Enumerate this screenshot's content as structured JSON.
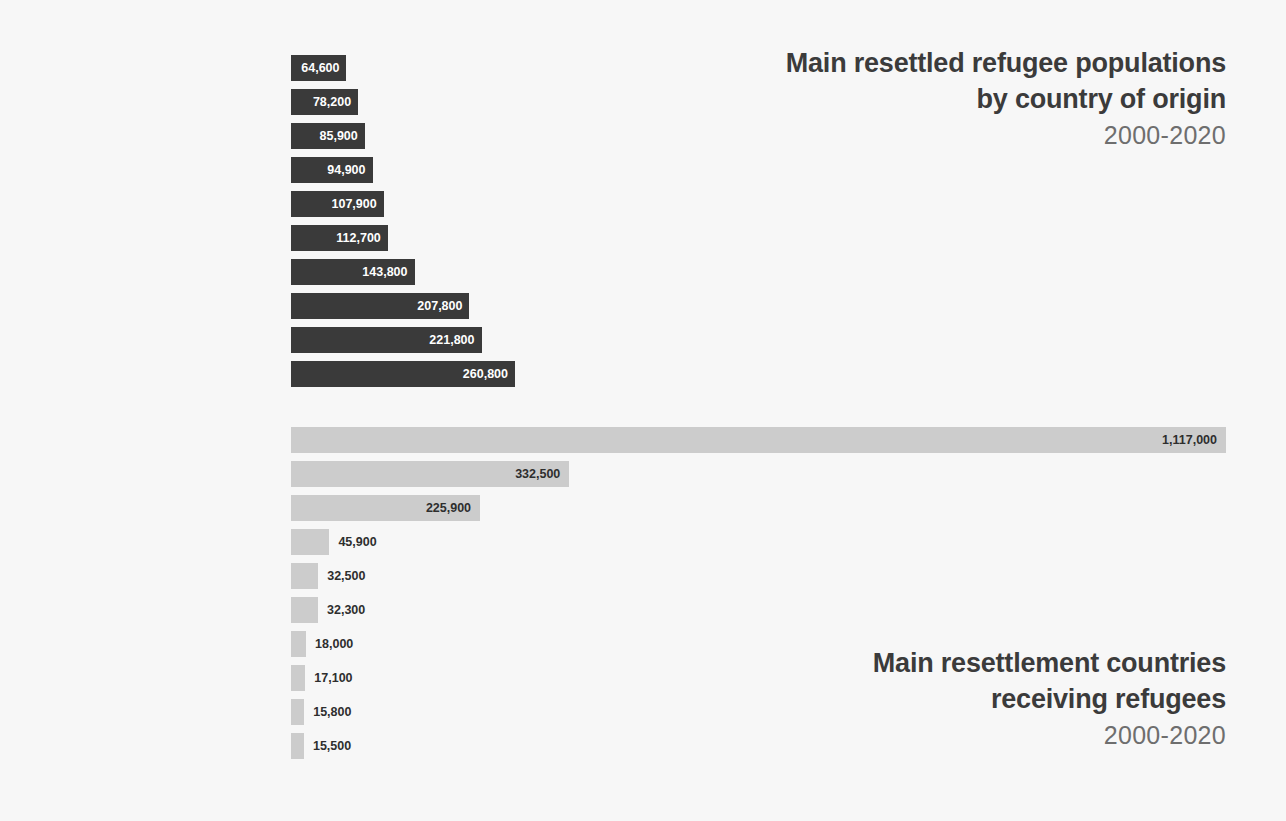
{
  "chart_data": [
    {
      "type": "bar",
      "orientation": "horizontal",
      "id": "origin",
      "title": "Main resettled refugee populations by country of origin",
      "title_lines": [
        "Main resettled refugee populations",
        "by country of origin"
      ],
      "period": "2000-2020",
      "xlabel": "",
      "ylabel": "",
      "grid": false,
      "legend": "none",
      "bar_color": "#3a3a3a",
      "label_color": "#ffffff",
      "xlim": [
        0,
        260800
      ],
      "categories": [
        "Eritrea",
        "Sudan",
        "Iran (Islamic Republic of)",
        "Afghanistan",
        "Bhutan",
        "Democratic Republic of the Congo",
        "Somalia",
        "Syrian Arab Republic",
        "Myanmar",
        "Iraq"
      ],
      "values": [
        64600,
        78200,
        85900,
        94900,
        107900,
        112700,
        143800,
        207800,
        221800,
        260800
      ],
      "value_labels": [
        "64,600",
        "78,200",
        "85,900",
        "94,900",
        "107,900",
        "112,700",
        "143,800",
        "207,800",
        "221,800",
        "260,800"
      ]
    },
    {
      "type": "bar",
      "orientation": "horizontal",
      "id": "destination",
      "title": "Main resettlement countries receiving refugees",
      "title_lines": [
        "Main resettlement countries",
        "receiving refugees"
      ],
      "period": "2000-2020",
      "xlabel": "",
      "ylabel": "",
      "grid": false,
      "legend": "none",
      "bar_color": "#cccccc",
      "label_color": "#2e2e2e",
      "xlim": [
        0,
        1117000
      ],
      "categories": [
        "United States of America",
        "Canada",
        "Australia",
        "Sweden",
        "Norway",
        "United Kingdom",
        "Germany",
        "France",
        "New Zealand",
        "Finland"
      ],
      "values": [
        1117000,
        332500,
        225900,
        45900,
        32500,
        32300,
        18000,
        17100,
        15800,
        15500
      ],
      "value_labels": [
        "1,117,000",
        "332,500",
        "225,900",
        "45,900",
        "32,500",
        "32,300",
        "18,000",
        "17,100",
        "15,800",
        "15,500"
      ]
    }
  ],
  "origin_chart": {
    "title_line1": "Main resettled refugee populations",
    "title_line2": "by country of origin",
    "period": "2000-2020",
    "rows": [
      {
        "label": "Eritrea",
        "value_label": "64,600"
      },
      {
        "label": "Sudan",
        "value_label": "78,200"
      },
      {
        "label": "Iran (Islamic Republic of)",
        "value_label": "85,900"
      },
      {
        "label": "Afghanistan",
        "value_label": "94,900"
      },
      {
        "label": "Bhutan",
        "value_label": "107,900"
      },
      {
        "label": "Democratic Republic of the Congo",
        "value_label": "112,700"
      },
      {
        "label": "Somalia",
        "value_label": "143,800"
      },
      {
        "label": "Syrian Arab Republic",
        "value_label": "207,800"
      },
      {
        "label": "Myanmar",
        "value_label": "221,800"
      },
      {
        "label": "Iraq",
        "value_label": "260,800"
      }
    ]
  },
  "destination_chart": {
    "title_line1": "Main resettlement countries",
    "title_line2": "receiving refugees",
    "period": "2000-2020",
    "rows": [
      {
        "label": "United States of America",
        "value_label": "1,117,000"
      },
      {
        "label": "Canada",
        "value_label": "332,500"
      },
      {
        "label": "Australia",
        "value_label": "225,900"
      },
      {
        "label": "Sweden",
        "value_label": "45,900"
      },
      {
        "label": "Norway",
        "value_label": "32,500"
      },
      {
        "label": "United Kingdom",
        "value_label": "32,300"
      },
      {
        "label": "Germany",
        "value_label": "18,000"
      },
      {
        "label": "France",
        "value_label": "17,100"
      },
      {
        "label": "New Zealand",
        "value_label": "15,800"
      },
      {
        "label": "Finland",
        "value_label": "15,500"
      }
    ]
  },
  "colors": {
    "background": "#f7f7f7",
    "origin_bar": "#3a3a3a",
    "destination_bar": "#cccccc",
    "title_text": "#3b3b3b",
    "period_text": "#6e6e6e",
    "label_text": "#2e2e2e"
  }
}
